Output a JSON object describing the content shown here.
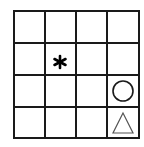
{
  "grid": {
    "rows": 4,
    "cols": 4,
    "line_color": "#1a1a1a",
    "background": "#ffffff"
  },
  "symbols": [
    {
      "type": "asterisk",
      "row": 1,
      "col": 1,
      "glyph": "*"
    },
    {
      "type": "circle",
      "row": 2,
      "col": 3
    },
    {
      "type": "triangle",
      "row": 3,
      "col": 3
    }
  ]
}
